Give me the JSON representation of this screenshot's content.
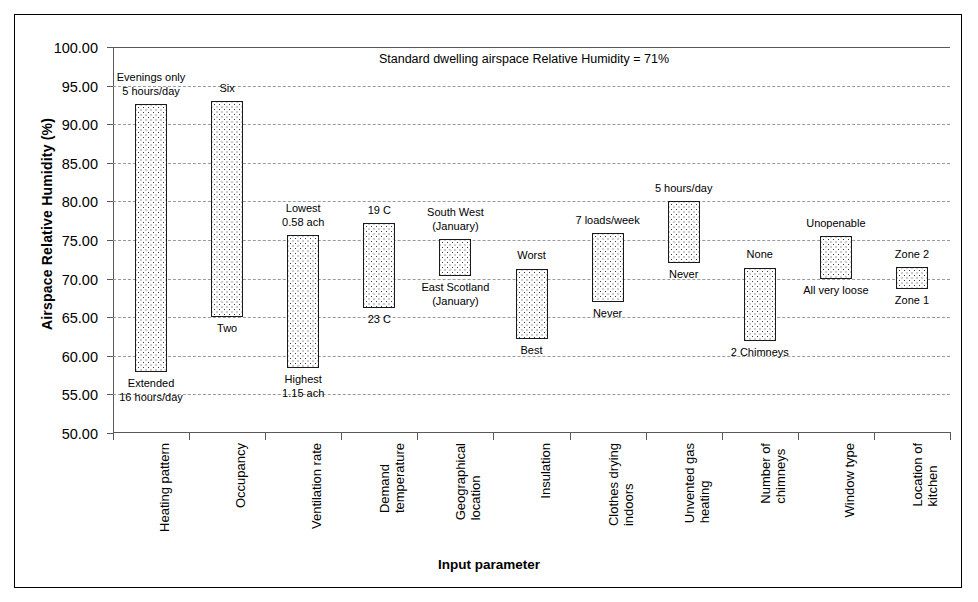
{
  "chart_data": {
    "type": "bar",
    "title": "Standard dwelling airspace Relative Humidity = 71%",
    "xlabel": "Input parameter",
    "ylabel": "Airspace Relative Humidity (%)",
    "ylim": [
      50.0,
      100.0
    ],
    "ytick_step": 5.0,
    "ytick_labels": [
      "100.00",
      "95.00",
      "90.00",
      "85.00",
      "80.00",
      "75.00",
      "70.00",
      "65.00",
      "60.00",
      "55.00",
      "50.00"
    ],
    "ytick_values": [
      100.0,
      95.0,
      90.0,
      85.0,
      80.0,
      75.0,
      70.0,
      65.0,
      60.0,
      55.0,
      50.0
    ],
    "grid": true,
    "legend": "none",
    "baseline_reference": 71,
    "categories": [
      "Heating pattern",
      "Occupancy",
      "Ventilation rate",
      "Demand temperature",
      "Geographical location",
      "Insulation",
      "Clothes drying indoors",
      "Unvented gas heating",
      "Number of chimneys",
      "Window type",
      "Location of kitchen"
    ],
    "category_labels_wrapped": [
      "Heating pattern",
      "Occupancy",
      "Ventilation rate",
      "Demand\ntemperature",
      "Geographical\nlocation",
      "Insulation",
      "Clothes drying\nindoors",
      "Unvented gas\nheating",
      "Number of\nchimneys",
      "Window type",
      "Location of\nkitchen"
    ],
    "bars": [
      {
        "category": "Heating pattern",
        "low": 57.9,
        "high": 92.6,
        "top_label": "Evenings only\n5 hours/day",
        "bottom_label": "Extended\n16 hours/day"
      },
      {
        "category": "Occupancy",
        "low": 65.0,
        "high": 93.0,
        "top_label": "Six",
        "bottom_label": "Two"
      },
      {
        "category": "Ventilation rate",
        "low": 58.4,
        "high": 75.6,
        "top_label": "Lowest\n0.58 ach",
        "bottom_label": "Highest\n1.15 ach"
      },
      {
        "category": "Demand temperature",
        "low": 66.2,
        "high": 77.2,
        "top_label": "19 C",
        "bottom_label": "23 C"
      },
      {
        "category": "Geographical location",
        "low": 70.3,
        "high": 75.1,
        "top_label": "South West\n(January)",
        "bottom_label": "East Scotland\n(January)"
      },
      {
        "category": "Insulation",
        "low": 62.2,
        "high": 71.3,
        "top_label": "Worst",
        "bottom_label": "Best"
      },
      {
        "category": "Clothes drying indoors",
        "low": 67.0,
        "high": 75.9,
        "top_label": "7 loads/week",
        "bottom_label": "Never"
      },
      {
        "category": "Unvented gas heating",
        "low": 72.0,
        "high": 80.0,
        "top_label": "5 hours/day",
        "bottom_label": "Never"
      },
      {
        "category": "Number of chimneys",
        "low": 61.9,
        "high": 71.4,
        "top_label": "None",
        "bottom_label": "2 Chimneys"
      },
      {
        "category": "Window type",
        "low": 69.9,
        "high": 75.5,
        "top_label": "Unopenable",
        "bottom_label": "All very loose"
      },
      {
        "category": "Location of kitchen",
        "low": 68.7,
        "high": 71.5,
        "top_label": "Zone 2",
        "bottom_label": "Zone 1"
      }
    ]
  },
  "colors": {
    "axis": "#595959",
    "grid": "#9a9a9a",
    "bar_edge": "#1a1a1a",
    "bar_pattern": "#3a3a3a",
    "background": "#ffffff"
  }
}
